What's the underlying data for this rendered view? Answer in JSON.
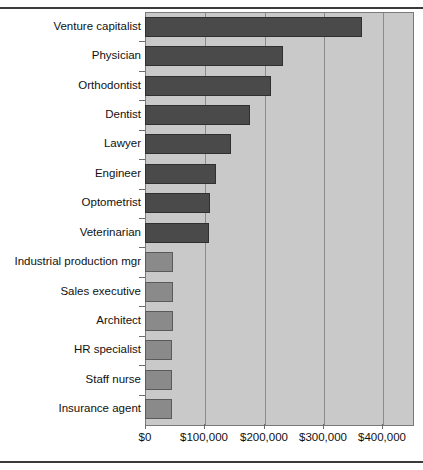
{
  "chart_data": {
    "type": "bar",
    "orientation": "horizontal",
    "title": "",
    "subtitle": "",
    "xlabel": "",
    "ylabel": "",
    "xlim": [
      0,
      450000
    ],
    "grid": true,
    "legend": null,
    "xticks": [
      "$0",
      "$100,000",
      "$200,000",
      "$300,000",
      "$400,000"
    ],
    "xtick_values": [
      0,
      100000,
      200000,
      300000,
      400000
    ],
    "categories": [
      "Venture capitalist",
      "Physician",
      "Orthodontist",
      "Dentist",
      "Lawyer",
      "Engineer",
      "Optometrist",
      "Veterinarian",
      "Industrial production mgr",
      "Sales executive",
      "Architect",
      "HR specialist",
      "Staff nurse",
      "Insurance agent"
    ],
    "values": [
      365000,
      233000,
      212000,
      177000,
      145000,
      119000,
      110000,
      108000,
      48000,
      47000,
      47000,
      46000,
      45000,
      45000
    ],
    "bar_colors": [
      "#4a4a4a",
      "#4a4a4a",
      "#4a4a4a",
      "#4a4a4a",
      "#4a4a4a",
      "#4a4a4a",
      "#4a4a4a",
      "#4a4a4a",
      "#8a8a8a",
      "#8a8a8a",
      "#8a8a8a",
      "#8a8a8a",
      "#8a8a8a",
      "#8a8a8a"
    ],
    "plot_background": "#c9c9c9",
    "gridline_color": "#8c8c8c",
    "frame_color": "#3a3a3a"
  }
}
